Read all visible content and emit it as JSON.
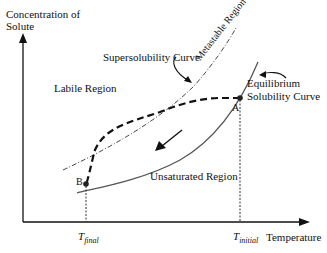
{
  "diagram": {
    "y_axis_label_line1": "Concentration of",
    "y_axis_label_line2": "Solute",
    "x_axis_label": "Temperature",
    "regions": {
      "labile": "Labile Region",
      "metastable": "Metastable Region",
      "unsaturated": "Unsaturated Region"
    },
    "curves": {
      "supersolubility": "Supersolubility Curve",
      "equilibrium_line1": "Equilibrium",
      "equilibrium_line2": "Solubility Curve"
    },
    "points": {
      "a": "A",
      "b": "B"
    },
    "ticks": {
      "t_final_main": "T",
      "t_final_sub": "final",
      "t_initial_main": "T",
      "t_initial_sub": "initial"
    },
    "colors": {
      "equilibrium_curve": "#555555",
      "supersolubility_curve": "#333333",
      "path": "#111111",
      "axis": "#111111"
    }
  }
}
